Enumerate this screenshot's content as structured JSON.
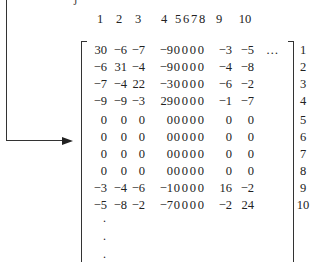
{
  "figure": {
    "top_fragment": "j",
    "column_headers": [
      "1",
      "2",
      "3",
      "4",
      "5",
      "6",
      "7",
      "8",
      "9",
      "10"
    ],
    "row_labels": [
      "1",
      "2",
      "3",
      "4",
      "5",
      "6",
      "7",
      "8",
      "9",
      "10"
    ],
    "ellipsis_first_row": "…",
    "vertical_continuation": [
      ".",
      ".",
      "."
    ],
    "matrix": [
      [
        "30",
        "−6",
        "−7",
        "−9",
        "0",
        "0",
        "0",
        "0",
        "−3",
        "−5"
      ],
      [
        "−6",
        "31",
        "−4",
        "−9",
        "0",
        "0",
        "0",
        "0",
        "−4",
        "−8"
      ],
      [
        "−7",
        "−4",
        "22",
        "−3",
        "0",
        "0",
        "0",
        "0",
        "−6",
        "−2"
      ],
      [
        "−9",
        "−9",
        "−3",
        "29",
        "0",
        "0",
        "0",
        "0",
        "−1",
        "−7"
      ],
      [
        "0",
        "0",
        "0",
        "0",
        "0",
        "0",
        "0",
        "0",
        "0",
        "0"
      ],
      [
        "0",
        "0",
        "0",
        "0",
        "0",
        "0",
        "0",
        "0",
        "0",
        "0"
      ],
      [
        "0",
        "0",
        "0",
        "0",
        "0",
        "0",
        "0",
        "0",
        "0",
        "0"
      ],
      [
        "0",
        "0",
        "0",
        "0",
        "0",
        "0",
        "0",
        "0",
        "0",
        "0"
      ],
      [
        "−3",
        "−4",
        "−6",
        "−1",
        "0",
        "0",
        "0",
        "0",
        "16",
        "−2"
      ],
      [
        "−5",
        "−8",
        "−2",
        "−7",
        "0",
        "0",
        "0",
        "0",
        "−2",
        "24"
      ]
    ],
    "arrow_target_row": "5"
  }
}
